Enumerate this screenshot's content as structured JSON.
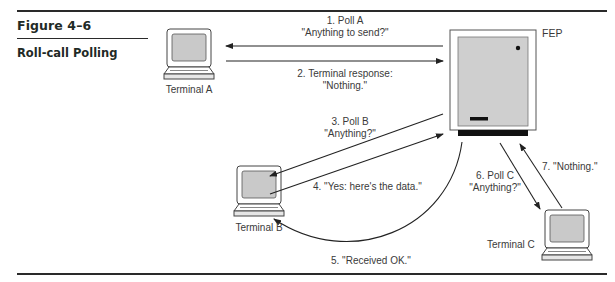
{
  "figure": {
    "number": "Figure 4–6",
    "title": "Roll-call Polling"
  },
  "nodes": {
    "fep": "FEP",
    "terminal_a": "Terminal A",
    "terminal_b": "Terminal B",
    "terminal_c": "Terminal C"
  },
  "messages": [
    {
      "step": 1,
      "line1": "1. Poll A",
      "line2": "\"Anything to send?\"",
      "from": "FEP",
      "to": "Terminal A"
    },
    {
      "step": 2,
      "line1": "2. Terminal response:",
      "line2": "\"Nothing.\"",
      "from": "Terminal A",
      "to": "FEP"
    },
    {
      "step": 3,
      "line1": "3. Poll B",
      "line2": "\"Anything?\"",
      "from": "FEP",
      "to": "Terminal B"
    },
    {
      "step": 4,
      "line1": "4. \"Yes: here's the data.\"",
      "from": "Terminal B",
      "to": "FEP"
    },
    {
      "step": 5,
      "line1": "5. \"Received OK.\"",
      "from": "FEP",
      "to": "Terminal B"
    },
    {
      "step": 6,
      "line1": "6. Poll C",
      "line2": "\"Anything?\"",
      "from": "FEP",
      "to": "Terminal C"
    },
    {
      "step": 7,
      "line1": "7. \"Nothing.\"",
      "from": "Terminal C",
      "to": "FEP"
    }
  ],
  "colors": {
    "rule": "#2a2a2a",
    "screen_fill": "#c9c9c9",
    "fep_panel": "#cfcfcf",
    "ink": "#222222"
  }
}
